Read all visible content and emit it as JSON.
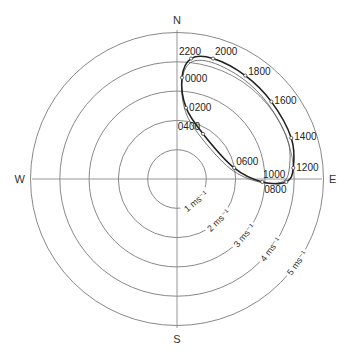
{
  "chart_data": {
    "type": "line",
    "subtype": "polar-hodograph",
    "title": "",
    "compass": {
      "north": "N",
      "south": "S",
      "east": "E",
      "west": "W"
    },
    "rings": [
      {
        "value": 1,
        "label": "1 ms⁻¹"
      },
      {
        "value": 2,
        "label": "2 ms⁻¹"
      },
      {
        "value": 3,
        "label": "3 ms⁻¹"
      },
      {
        "value": 4,
        "label": "4 ms⁻¹"
      },
      {
        "value": 5,
        "label": "5 ms⁻¹"
      }
    ],
    "rmax": 5,
    "units": "ms⁻¹",
    "series": [
      {
        "name": "hodograph",
        "points": [
          {
            "label": "0000",
            "u": 0.17,
            "v": 3.46
          },
          {
            "label": "0200",
            "u": 0.31,
            "v": 2.43
          },
          {
            "label": "0400",
            "u": 0.89,
            "v": 1.54
          },
          {
            "label": "0600",
            "u": 1.95,
            "v": 0.38
          },
          {
            "label": "0800",
            "u": 2.91,
            "v": -0.1
          },
          {
            "label": "1000",
            "u": 3.73,
            "v": -0.1
          },
          {
            "label": "1200",
            "u": 3.97,
            "v": 0.38
          },
          {
            "label": "1400",
            "u": 3.9,
            "v": 1.4
          },
          {
            "label": "1600",
            "u": 3.22,
            "v": 2.64
          },
          {
            "label": "1800",
            "u": 2.33,
            "v": 3.53
          },
          {
            "label": "2000",
            "u": 1.23,
            "v": 4.11
          },
          {
            "label": "2200",
            "u": 0.48,
            "v": 4.11
          }
        ]
      }
    ],
    "grid": true,
    "legend": null
  }
}
